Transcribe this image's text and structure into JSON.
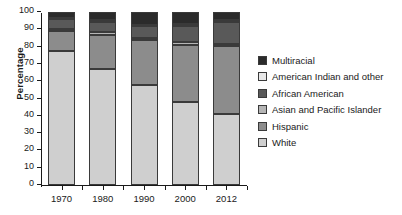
{
  "chart_data": {
    "type": "bar",
    "stacked": true,
    "title": "",
    "subtitle": "",
    "xlabel": "",
    "ylabel": "Percentage",
    "categories": [
      "1970",
      "1980",
      "1990",
      "2000",
      "2012"
    ],
    "ylim": [
      0,
      100
    ],
    "ytick_labels": [
      "0",
      "10",
      "20",
      "30",
      "40",
      "50",
      "60",
      "70",
      "80",
      "90",
      "100"
    ],
    "ytick_values": [
      0,
      10,
      20,
      30,
      40,
      50,
      60,
      70,
      80,
      90,
      100
    ],
    "grid": false,
    "legend_position": "right",
    "series": [
      {
        "name": "White",
        "color": "#cfcfcf",
        "values": [
          77.4,
          67.0,
          57.6,
          48.0,
          41.3
        ]
      },
      {
        "name": "Hispanic",
        "color": "#8c8c8c",
        "values": [
          11.4,
          19.7,
          26.0,
          32.9,
          39.1
        ]
      },
      {
        "name": "Asian and Pacific Islander",
        "color": "#b5b5b5",
        "values": [
          1.3,
          1.5,
          1.5,
          1.5,
          1.4
        ]
      },
      {
        "name": "African American",
        "color": "#595959",
        "values": [
          5.6,
          6.3,
          6.6,
          9.5,
          12.4
        ]
      },
      {
        "name": "American Indian and other",
        "color": "#e8e8e8",
        "values": [
          0.9,
          0.9,
          1.0,
          1.0,
          1.0
        ]
      },
      {
        "name": "Multiracial",
        "color": "#2b2b2b",
        "values": [
          3.4,
          4.6,
          7.3,
          7.1,
          4.8
        ]
      }
    ],
    "stack_order_bottom_to_top": [
      "White",
      "Hispanic",
      "Asian and Pacific Islander",
      "African American",
      "American Indian and other",
      "Multiracial"
    ]
  },
  "legend": {
    "entries": [
      {
        "label": "Multiracial",
        "color": "#2b2b2b"
      },
      {
        "label": "American Indian and other",
        "color": "#e8e8e8"
      },
      {
        "label": "African American",
        "color": "#595959"
      },
      {
        "label": "Asian and Pacific Islander",
        "color": "#b5b5b5"
      },
      {
        "label": "Hispanic",
        "color": "#8c8c8c"
      },
      {
        "label": "White",
        "color": "#cfcfcf"
      }
    ]
  }
}
